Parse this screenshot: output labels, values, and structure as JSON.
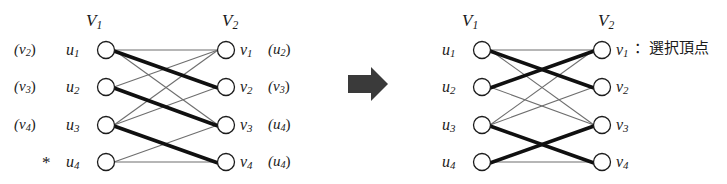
{
  "figure": {
    "caption_text": "二部グラフのマッチング図",
    "arrow": {
      "name": "right-arrow",
      "direction": "right",
      "color": "#3a3a3a"
    }
  },
  "colors": {
    "thin_edge": "#6e6e6e",
    "thick_edge": "#101010",
    "node_stroke": "#1c1c1c",
    "node_fill": "#ffffff",
    "text": "#1a1a1a",
    "arrow": "#3a3a3a"
  },
  "left_panel": {
    "header_v1": "V",
    "header_v1_sub": "1",
    "header_v2": "V",
    "header_v2_sub": "2",
    "left_nodes": [
      {
        "label": "u",
        "sub": "1",
        "prefix": "(v",
        "prefix_sub": "2",
        "prefix_close": ")"
      },
      {
        "label": "u",
        "sub": "2",
        "prefix": "(v",
        "prefix_sub": "3",
        "prefix_close": ")"
      },
      {
        "label": "u",
        "sub": "3",
        "prefix": "(v",
        "prefix_sub": "4",
        "prefix_close": ")"
      },
      {
        "label": "u",
        "sub": "4",
        "prefix": "*",
        "prefix_sub": "",
        "prefix_close": ""
      }
    ],
    "right_nodes": [
      {
        "label": "v",
        "sub": "1",
        "suffix": "(u",
        "suffix_sub": "2",
        "suffix_close": ")"
      },
      {
        "label": "v",
        "sub": "2",
        "suffix": "(v",
        "suffix_sub": "3",
        "suffix_close": ")"
      },
      {
        "label": "v",
        "sub": "3",
        "suffix": "(u",
        "suffix_sub": "4",
        "suffix_close": ")"
      },
      {
        "label": "v",
        "sub": "4",
        "suffix": "(u",
        "suffix_sub": "4",
        "suffix_close": ")"
      }
    ],
    "edges": [
      {
        "from": 0,
        "to": 0,
        "weight": "thin"
      },
      {
        "from": 0,
        "to": 1,
        "weight": "thick"
      },
      {
        "from": 0,
        "to": 2,
        "weight": "thin"
      },
      {
        "from": 1,
        "to": 0,
        "weight": "thin"
      },
      {
        "from": 1,
        "to": 2,
        "weight": "thick"
      },
      {
        "from": 2,
        "to": 0,
        "weight": "thin"
      },
      {
        "from": 2,
        "to": 1,
        "weight": "thin"
      },
      {
        "from": 2,
        "to": 3,
        "weight": "thick"
      },
      {
        "from": 3,
        "to": 2,
        "weight": "thin"
      },
      {
        "from": 3,
        "to": 3,
        "weight": "thin"
      }
    ]
  },
  "right_panel": {
    "header_v1": "V",
    "header_v1_sub": "1",
    "header_v2": "V",
    "header_v2_sub": "2",
    "left_nodes": [
      {
        "label": "u",
        "sub": "1"
      },
      {
        "label": "u",
        "sub": "2"
      },
      {
        "label": "u",
        "sub": "3"
      },
      {
        "label": "u",
        "sub": "4"
      }
    ],
    "right_nodes": [
      {
        "label": "v",
        "sub": "1"
      },
      {
        "label": "v",
        "sub": "2"
      },
      {
        "label": "v",
        "sub": "3"
      },
      {
        "label": "v",
        "sub": "4"
      }
    ],
    "legend": {
      "separator": "：",
      "text": "選択頂点"
    },
    "edges": [
      {
        "from": 0,
        "to": 0,
        "weight": "thin"
      },
      {
        "from": 0,
        "to": 1,
        "weight": "thick"
      },
      {
        "from": 0,
        "to": 2,
        "weight": "thin"
      },
      {
        "from": 1,
        "to": 0,
        "weight": "thick"
      },
      {
        "from": 1,
        "to": 2,
        "weight": "thin"
      },
      {
        "from": 2,
        "to": 0,
        "weight": "thin"
      },
      {
        "from": 2,
        "to": 1,
        "weight": "thin"
      },
      {
        "from": 2,
        "to": 3,
        "weight": "thick"
      },
      {
        "from": 3,
        "to": 2,
        "weight": "thick"
      },
      {
        "from": 3,
        "to": 3,
        "weight": "thin"
      }
    ]
  }
}
